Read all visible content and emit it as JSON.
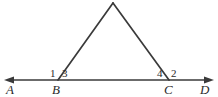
{
  "figure": {
    "background_color": "#ffffff",
    "stroke_color": "#3a3a3a",
    "text_color": "#2b2b2b",
    "points": [
      {
        "id": "A",
        "label": "A",
        "x": 8,
        "y": 80,
        "role": "line-endpoint-left"
      },
      {
        "id": "B",
        "label": "B",
        "x": 58,
        "y": 80,
        "role": "triangle-vertex-left"
      },
      {
        "id": "C",
        "label": "C",
        "x": 169,
        "y": 80,
        "role": "triangle-vertex-right"
      },
      {
        "id": "D",
        "label": "D",
        "x": 210,
        "y": 80,
        "role": "line-endpoint-right"
      },
      {
        "id": "apex",
        "label": "",
        "x": 113,
        "y": 3,
        "role": "triangle-apex"
      }
    ],
    "angles": [
      {
        "id": "angle-1",
        "label": "1",
        "at_point": "B",
        "x": 50,
        "y": 68,
        "description": "exterior angle left of B"
      },
      {
        "id": "angle-3",
        "label": "3",
        "at_point": "B",
        "x": 62,
        "y": 68,
        "description": "interior angle at B"
      },
      {
        "id": "angle-4",
        "label": "4",
        "at_point": "C",
        "x": 157,
        "y": 68,
        "description": "interior angle at C"
      },
      {
        "id": "angle-2",
        "label": "2",
        "at_point": "C",
        "x": 171,
        "y": 68,
        "description": "exterior angle right of C"
      }
    ],
    "segments": [
      {
        "id": "baseline",
        "from": "A",
        "to": "D",
        "arrow_start": true,
        "arrow_end": true
      },
      {
        "id": "left-leg",
        "from": "B",
        "to": "apex",
        "arrow_start": false,
        "arrow_end": false
      },
      {
        "id": "right-leg",
        "from": "apex",
        "to": "C",
        "arrow_start": false,
        "arrow_end": false
      }
    ]
  }
}
